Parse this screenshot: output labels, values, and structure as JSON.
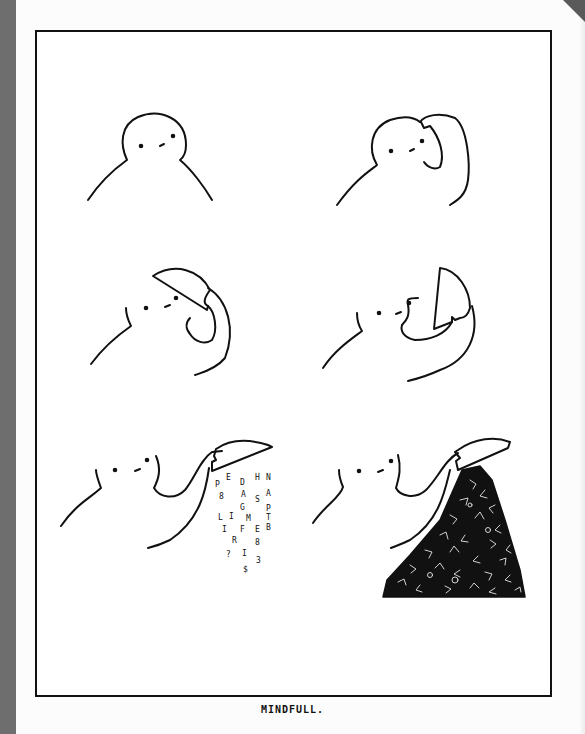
{
  "comic": {
    "caption": "MINDFULL.",
    "panels": [
      {
        "id": 1,
        "description": "figure sitting calmly"
      },
      {
        "id": 2,
        "description": "figure lifting the top of its head"
      },
      {
        "id": 3,
        "description": "head top opened like a lid"
      },
      {
        "id": 4,
        "description": "head top tilted back further"
      },
      {
        "id": 5,
        "description": "letters pouring out of the head"
      },
      {
        "id": 6,
        "description": "large pile of letters poured out"
      }
    ],
    "falling_letters": [
      "P",
      "E",
      "D",
      "H",
      "N",
      "8",
      "A",
      "S",
      "A",
      "G",
      "P",
      "L",
      "I",
      "M",
      "T",
      "I",
      "F",
      "E",
      "B",
      "R",
      "8",
      "?",
      "I",
      "3",
      "$"
    ]
  }
}
